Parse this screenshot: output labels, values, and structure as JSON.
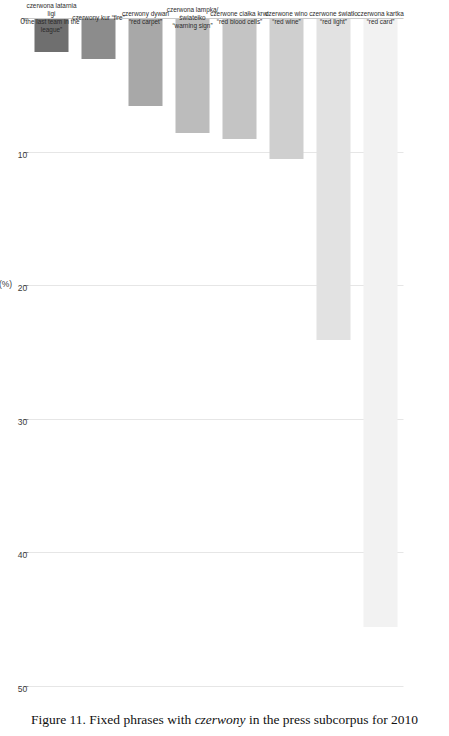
{
  "caption": {
    "prefix": "Figure 11.",
    "text_before": " Fixed phrases with ",
    "italic": "czerwony",
    "text_after": " in the press subcorpus for 2010"
  },
  "chart_data": {
    "type": "bar",
    "orientation": "horizontal",
    "title": "",
    "xlabel": "",
    "ylabel": "(%)",
    "axis_label": "(%)",
    "ylim": [
      0,
      50
    ],
    "grid": true,
    "legend": "none",
    "tick_labels": [
      "0",
      "10",
      "20",
      "30",
      "40",
      "50"
    ],
    "tick_values": [
      0,
      10,
      20,
      30,
      40,
      50
    ],
    "categories": [
      "czerwona kartka\n“red card”",
      "czerwone światło\n“red light”",
      "czerwone wino\n“red wine”",
      "czerwone ciałka krwi\n“red blood cells”",
      "czerwona lampka/\nświatełko\n“warning sign”",
      "czerwony dywan\n“red carpet”",
      "czerwony kur “fire”",
      "czerwona latarnia\nligi\n“the last team in the\nleague”"
    ],
    "values": [
      45.5,
      24.0,
      10.5,
      9.0,
      8.5,
      6.5,
      3.0,
      2.5
    ],
    "bar_colors": [
      "#f2f2f2",
      "#e2e2e2",
      "#cfcfcf",
      "#c4c4c4",
      "#bcbcbc",
      "#a8a8a8",
      "#8c8c8c",
      "#6f6f6f"
    ]
  },
  "colors": {
    "gridline": "#e6e6e6",
    "axis": "#c9c9c9",
    "text": "#2b2b2b",
    "background": "#ffffff"
  }
}
